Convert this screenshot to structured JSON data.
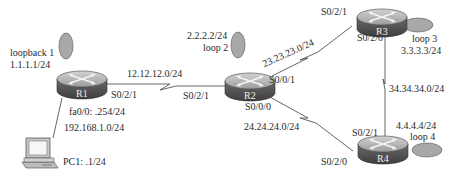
{
  "routers": [
    {
      "id": "R1",
      "label": "R1",
      "x": 82,
      "y": 80
    },
    {
      "id": "R2",
      "label": "R2",
      "x": 250,
      "y": 82
    },
    {
      "id": "R3",
      "label": "R3",
      "x": 376,
      "y": 17
    },
    {
      "id": "R4",
      "label": "R4",
      "x": 376,
      "y": 150
    }
  ],
  "loopbacks": {
    "r1": {
      "name": "loopback 1",
      "ip": "1.1.1.1/24"
    },
    "r2": {
      "name": "loop 2",
      "ip": "2.2.2.2/24"
    },
    "r3": {
      "name": "loop 3",
      "ip": "3.3.3.3/24"
    },
    "r4": {
      "name": "loop 4",
      "ip": "4.4.4.4/24"
    }
  },
  "links": {
    "r1_r2": {
      "network": "12.12.12.0/24",
      "r1_if": "S0/2/1",
      "r2_if": "S0/2/1"
    },
    "r2_r3": {
      "network": "23.23.23.0/24",
      "r2_if": "S0/0/1",
      "r3_if": "S0/2/1"
    },
    "r2_r4": {
      "network": "24.24.24.0/24",
      "r2_if": "S0/0/0",
      "r4_if": "S0/2/0"
    },
    "r3_r4": {
      "network": "34.34.34.0/24",
      "r3_if": "S0/2/0",
      "r4_if": "S0/2/1"
    },
    "r1_pc1": {
      "network": "192.168.1.0/24",
      "r1_if": "fa0/0: .254/24"
    }
  },
  "pc": {
    "label": "PC1: .1/24"
  },
  "colors": {
    "router_top": "#b8b8b8",
    "router_side": "#5a5a5a",
    "loopback_fill": "#a8a8a8",
    "line": "#555555"
  }
}
